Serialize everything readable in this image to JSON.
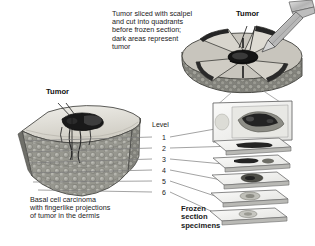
{
  "figure": {
    "background_color": "#ffffff",
    "ink_color": "#1a1a1a"
  },
  "captions": {
    "top_note": "Tumor sliced with scalpel\nand cut into quadrants\nbefore frozen section;\ndark areas represent\ntumor",
    "bottom_note": "Basal cell carcinoma\nwith fingerlike projections\nof tumor in the dermis",
    "specimens_note": "Frozen\nsection\nspecimens"
  },
  "labels": {
    "tumor_left": "Tumor",
    "tumor_right": "Tumor",
    "level_heading": "Level"
  },
  "levels": [
    {
      "number": "1"
    },
    {
      "number": "2"
    },
    {
      "number": "3"
    },
    {
      "number": "4"
    },
    {
      "number": "5"
    },
    {
      "number": "6"
    }
  ],
  "colors": {
    "skin_top": "#d9d6ce",
    "dermis": "#9a9a93",
    "tumor_dark": "#1c1c1c",
    "slide_glass": "#f2f2f0",
    "slide_edge": "#8c8c8c",
    "scalpel": "#c9c9c9",
    "line": "#6f6f6f"
  }
}
